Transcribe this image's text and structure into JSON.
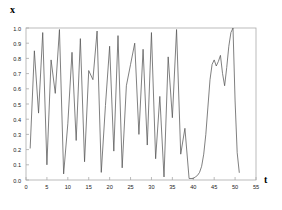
{
  "figure": {
    "ylabel": "x",
    "xlabel": "t",
    "line_color": "#555555",
    "frame_color": "#aaaaaa",
    "text_color": "#222222"
  },
  "chart_data": {
    "type": "line",
    "title": "",
    "xlabel": "t",
    "ylabel": "x",
    "xlim": [
      0,
      55
    ],
    "ylim": [
      0.0,
      1.0
    ],
    "grid": false,
    "legend": null,
    "xticks": [
      0,
      5,
      10,
      15,
      20,
      25,
      30,
      35,
      40,
      45,
      50,
      55
    ],
    "xticklabels": [
      "0",
      "5",
      "10",
      "15",
      "20",
      "25",
      "30",
      "35",
      "40",
      "45",
      "50",
      "55"
    ],
    "yticks": [
      0.0,
      0.1,
      0.2,
      0.3,
      0.4,
      0.5,
      0.6,
      0.7,
      0.8,
      0.9,
      1.0
    ],
    "yticklabels": [
      "0.0",
      "0.1",
      "0.2",
      "0.3",
      "0.4",
      "0.5",
      "0.6",
      "0.7",
      "0.8",
      "0.9",
      "1.0"
    ],
    "series": [
      {
        "name": "x(t)",
        "x": [
          1.0,
          2.0,
          3.0,
          4.0,
          5.0,
          6.0,
          7.0,
          8.0,
          9.0,
          10.0,
          11.0,
          12.0,
          13.0,
          14.0,
          15.0,
          16.0,
          17.0,
          18.0,
          19.0,
          20.0,
          21.0,
          22.0,
          23.0,
          24.0,
          25.0,
          26.0,
          27.0,
          28.0,
          29.0,
          30.0,
          31.0,
          32.0,
          33.0,
          34.0,
          35.0,
          36.0,
          37.0,
          38.0,
          39.0,
          40.0,
          40.5,
          41.0,
          41.5,
          42.0,
          42.5,
          43.0,
          43.5,
          44.0,
          44.5,
          45.0,
          45.5,
          46.0,
          46.5,
          47.0,
          47.5,
          48.0,
          48.5,
          49.0,
          49.5,
          50.0,
          50.5,
          51.0
        ],
        "y": [
          0.21,
          0.85,
          0.44,
          0.97,
          0.1,
          0.79,
          0.57,
          0.99,
          0.04,
          0.37,
          0.84,
          0.26,
          0.93,
          0.12,
          0.72,
          0.66,
          0.98,
          0.05,
          0.49,
          0.88,
          0.19,
          0.95,
          0.08,
          0.62,
          0.76,
          0.9,
          0.3,
          0.86,
          0.23,
          0.97,
          0.14,
          0.55,
          0.02,
          0.81,
          0.41,
          0.99,
          0.17,
          0.34,
          0.01,
          0.01,
          0.02,
          0.03,
          0.05,
          0.09,
          0.17,
          0.3,
          0.48,
          0.66,
          0.76,
          0.79,
          0.75,
          0.78,
          0.82,
          0.7,
          0.62,
          0.74,
          0.88,
          0.97,
          1.0,
          0.52,
          0.18,
          0.05
        ]
      }
    ]
  }
}
